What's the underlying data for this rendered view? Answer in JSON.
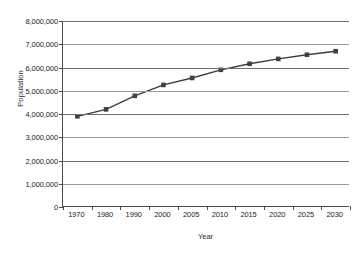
{
  "chart_data": {
    "type": "line",
    "title": "",
    "xlabel": "Year",
    "ylabel": "Population",
    "categories": [
      "1970",
      "1980",
      "1990",
      "2000",
      "2005",
      "2010",
      "2015",
      "2020",
      "2025",
      "2030"
    ],
    "series": [
      {
        "name": "Population",
        "values": [
          3900000,
          4200000,
          4780000,
          5250000,
          5550000,
          5900000,
          6160000,
          6370000,
          6550000,
          6700000
        ]
      }
    ],
    "ylim": [
      0,
      8000000
    ],
    "ytick_values": [
      0,
      1000000,
      2000000,
      3000000,
      4000000,
      5000000,
      6000000,
      7000000,
      8000000
    ],
    "ytick_labels": [
      "0",
      "1,000,000",
      "2,000,000",
      "3,000,000",
      "4,000,000",
      "5,000,000",
      "6,000,000",
      "7,000,000",
      "8,000,000"
    ],
    "grid": true,
    "legend": "none",
    "marker": "square",
    "marker_color": "#404040",
    "line_color": "#3d3d3d",
    "grid_color": "#9a9a9a",
    "axis_color": "#4a4a4a",
    "background": "#ffffff"
  }
}
